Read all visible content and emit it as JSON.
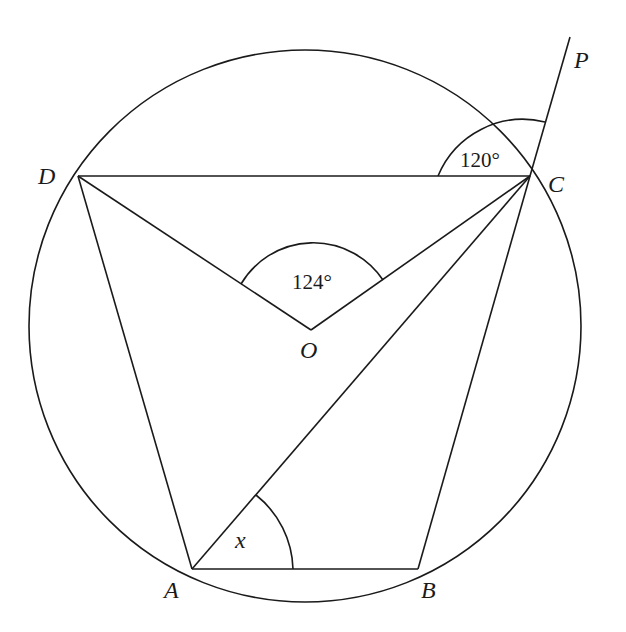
{
  "diagram": {
    "type": "circle-geometry",
    "circle": {
      "center": "O"
    },
    "points": {
      "A": {
        "label": "A"
      },
      "B": {
        "label": "B"
      },
      "C": {
        "label": "C"
      },
      "D": {
        "label": "D"
      },
      "O": {
        "label": "O"
      },
      "P": {
        "label": "P"
      }
    },
    "segments": [
      "DC",
      "DA",
      "DO",
      "OC",
      "AC",
      "AB",
      "BC",
      "CP"
    ],
    "angles": {
      "DCP": {
        "text": "120°",
        "vertex": "C"
      },
      "DOC": {
        "text": "124°",
        "vertex": "O"
      },
      "CAB": {
        "text": "x",
        "vertex": "A"
      }
    }
  }
}
